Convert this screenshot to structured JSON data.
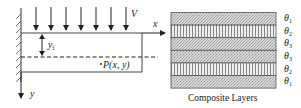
{
  "beam": {
    "load_label": "V",
    "x_axis_label": "x",
    "y_axis_label": "y",
    "offset_label": "y",
    "offset_sub": "f",
    "point_label": "P(x, y)",
    "num_load_arrows": 7
  },
  "composite": {
    "caption": "Composite Layers",
    "layers": [
      {
        "angle_symbol": "θ",
        "sub": "1",
        "pattern": "stipple"
      },
      {
        "angle_symbol": "θ",
        "sub": "2",
        "pattern": "vertical-stripes"
      },
      {
        "angle_symbol": "θ",
        "sub": "3",
        "pattern": "stipple"
      },
      {
        "angle_symbol": "θ",
        "sub": "3",
        "pattern": "stipple"
      },
      {
        "angle_symbol": "θ",
        "sub": "2",
        "pattern": "vertical-stripes"
      },
      {
        "angle_symbol": "θ",
        "sub": "1",
        "pattern": "stipple"
      }
    ]
  },
  "colors": {
    "line": "#333333",
    "stipple_fill": "#c8c8c8",
    "stripe_fill": "#e6e6e6"
  }
}
